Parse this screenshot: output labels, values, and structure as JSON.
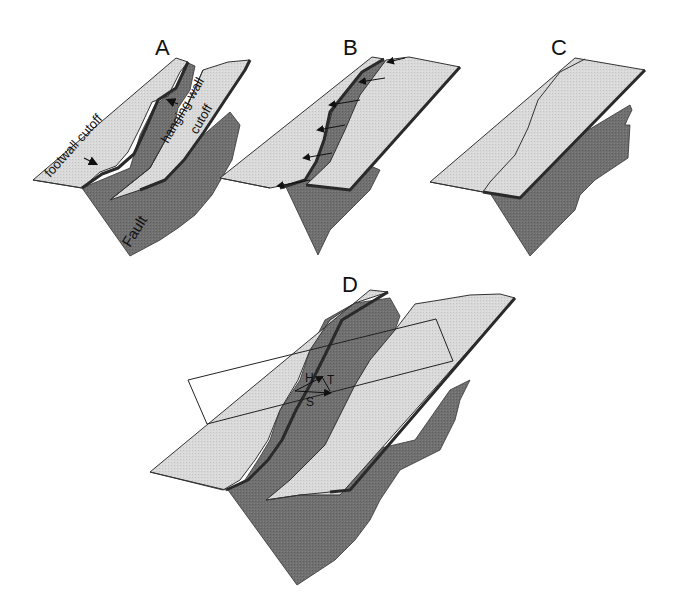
{
  "figure": {
    "type": "fault-cutoff-block-diagram",
    "colors": {
      "background": "#ffffff",
      "bed_slab": "#d6d6d6",
      "fault_surface": "#6e6e6e",
      "outline": "#2a2a2a"
    },
    "panels": [
      {
        "id": "A",
        "label": "A",
        "annotations": [
          "footwall cutoff",
          "hanging-wall cutoff",
          "Fault"
        ]
      },
      {
        "id": "B",
        "label": "B",
        "annotations": [],
        "arrows": 6
      },
      {
        "id": "C",
        "label": "C",
        "annotations": []
      },
      {
        "id": "D",
        "label": "D",
        "vector_labels": [
          "H",
          "T",
          "S"
        ]
      }
    ]
  },
  "labels": {
    "A": "A",
    "B": "B",
    "C": "C",
    "D": "D",
    "footwall": "footwall cutoff",
    "hanging1": "hanging-wall",
    "hanging2": "cutoff",
    "fault": "Fault",
    "H": "H",
    "T": "T",
    "S": "S"
  }
}
